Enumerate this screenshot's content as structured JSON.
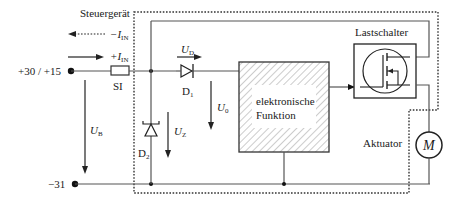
{
  "diagram": {
    "title": "Steuergerät",
    "supply_positive": "+30 / +15",
    "supply_ground": "−31",
    "fuse_label": "SI",
    "current_negative": {
      "symbol": "−I",
      "sub": "IN"
    },
    "current_positive": {
      "symbol": "+I",
      "sub": "IN"
    },
    "voltage_battery": {
      "symbol": "U",
      "sub": "B"
    },
    "voltage_diode": {
      "symbol": "U",
      "sub": "D"
    },
    "voltage_zener": {
      "symbol": "U",
      "sub": "Z"
    },
    "voltage_supply": {
      "symbol": "U",
      "sub": "0"
    },
    "diode1": {
      "symbol": "D",
      "sub": "1"
    },
    "diode2": {
      "symbol": "D",
      "sub": "2"
    },
    "block_line1": "elektronische",
    "block_line2": "Funktion",
    "switch_label": "Lastschalter",
    "actuator_label": "Aktuator",
    "motor_symbol": "M",
    "colors": {
      "line": "#555555",
      "text": "#1a1a1a",
      "hatch": "#9a9a9a",
      "background": "#ffffff"
    }
  }
}
